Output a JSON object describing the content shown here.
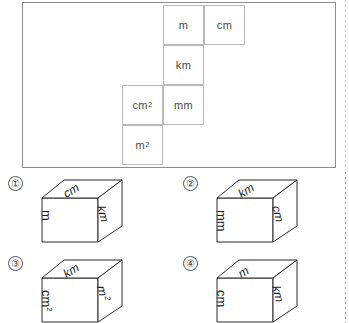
{
  "problem": {
    "net": {
      "cells": [
        {
          "id": "net-cell-m",
          "label": "m",
          "sup": "",
          "x": 140,
          "y": 2,
          "w": 41,
          "h": 40
        },
        {
          "id": "net-cell-cm",
          "label": "cm",
          "sup": "",
          "x": 181,
          "y": 2,
          "w": 41,
          "h": 40
        },
        {
          "id": "net-cell-km",
          "label": "km",
          "sup": "",
          "x": 140,
          "y": 42,
          "w": 41,
          "h": 40
        },
        {
          "id": "net-cell-cm2",
          "label": "cm",
          "sup": "2",
          "x": 99,
          "y": 82,
          "w": 41,
          "h": 40
        },
        {
          "id": "net-cell-mm",
          "label": "mm",
          "sup": "",
          "x": 140,
          "y": 82,
          "w": 41,
          "h": 40
        },
        {
          "id": "net-cell-m2",
          "label": "m",
          "sup": "2",
          "x": 99,
          "y": 122,
          "w": 41,
          "h": 40
        }
      ]
    }
  },
  "options": [
    {
      "number": "①",
      "name": "option-1",
      "x": 0,
      "y": 0,
      "front": {
        "label": "m",
        "sup": ""
      },
      "top": {
        "label": "cm",
        "sup": ""
      },
      "right": {
        "label": "km",
        "sup": ""
      }
    },
    {
      "number": "②",
      "name": "option-2",
      "x": 175,
      "y": 0,
      "front": {
        "label": "mm",
        "sup": ""
      },
      "top": {
        "label": "km",
        "sup": ""
      },
      "right": {
        "label": "cm",
        "sup": ""
      }
    },
    {
      "number": "③",
      "name": "option-3",
      "x": 0,
      "y": 80,
      "front": {
        "label": "cm",
        "sup": "2"
      },
      "top": {
        "label": "km",
        "sup": ""
      },
      "right": {
        "label": "m",
        "sup": "2"
      }
    },
    {
      "number": "④",
      "name": "option-4",
      "x": 175,
      "y": 80,
      "front": {
        "label": "cm",
        "sup": ""
      },
      "top": {
        "label": "m",
        "sup": ""
      },
      "right": {
        "label": "km",
        "sup": ""
      }
    }
  ]
}
